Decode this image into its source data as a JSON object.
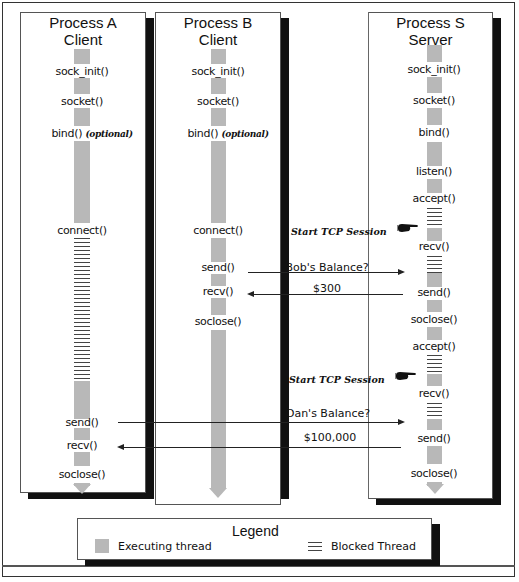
{
  "columns": [
    {
      "id": "a",
      "title_line1": "Process  A",
      "title_line2": "Client",
      "calls": [
        "sock_init()",
        "socket()",
        "bind()",
        "connect()",
        "send()",
        "recv()",
        "soclose()"
      ],
      "bind_note": "(optional)"
    },
    {
      "id": "b",
      "title_line1": "Process  B",
      "title_line2": "Client",
      "calls": [
        "sock_init()",
        "socket()",
        "bind()",
        "connect()",
        "send()",
        "recv()",
        "soclose()"
      ],
      "bind_note": "(optional)"
    },
    {
      "id": "s",
      "title_line1": "Process  S",
      "title_line2": "Server",
      "calls": [
        "sock_init()",
        "socket()",
        "bind()",
        "listen()",
        "accept()",
        "recv()",
        "send()",
        "soclose()",
        "accept()",
        "recv()",
        "send()",
        "soclose()"
      ]
    }
  ],
  "annotations": {
    "tcp_session_1": "Start TCP Session",
    "tcp_session_2": "Start TCP Session"
  },
  "messages": [
    {
      "from": "Process B",
      "to": "Process S",
      "label": "Bob's  Balance?"
    },
    {
      "from": "Process S",
      "to": "Process B",
      "label": "$300"
    },
    {
      "from": "Process A",
      "to": "Process S",
      "label": "Dan's  Balance?"
    },
    {
      "from": "Process S",
      "to": "Process A",
      "label": "$100,000"
    }
  ],
  "legend": {
    "title": "Legend",
    "executing": "Executing thread",
    "blocked": "Blocked Thread"
  },
  "colors": {
    "executing": "#b8b8b8",
    "blocked": "#444444",
    "shadow": "#111111"
  }
}
